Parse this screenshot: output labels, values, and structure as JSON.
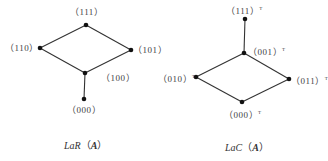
{
  "diagrams": [
    {
      "id": "lar",
      "caption": {
        "prefix": "LaR",
        "open": "（",
        "arg": "A",
        "close": "）"
      },
      "nodes": [
        {
          "id": "111",
          "label": "（111）",
          "x": 86,
          "y": 25
        },
        {
          "id": "110",
          "label": "（110）",
          "x": 40,
          "y": 48
        },
        {
          "id": "101",
          "label": "（101）",
          "x": 131,
          "y": 50
        },
        {
          "id": "100",
          "label": "（100）",
          "x": 85,
          "y": 73
        },
        {
          "id": "000",
          "label": "（000）",
          "x": 84,
          "y": 99
        }
      ],
      "edges": [
        [
          "111",
          "110"
        ],
        [
          "111",
          "101"
        ],
        [
          "110",
          "100"
        ],
        [
          "101",
          "100"
        ],
        [
          "100",
          "000"
        ]
      ]
    },
    {
      "id": "lac",
      "caption": {
        "prefix": "LaC",
        "open": "（",
        "arg": "A",
        "close": "）"
      },
      "superscript": "T",
      "nodes": [
        {
          "id": "111",
          "label": "（111）",
          "x": 245,
          "y": 19
        },
        {
          "id": "001",
          "label": "（001）",
          "x": 244,
          "y": 53
        },
        {
          "id": "010",
          "label": "（010）",
          "x": 196,
          "y": 77
        },
        {
          "id": "011",
          "label": "（011）",
          "x": 289,
          "y": 79
        },
        {
          "id": "000",
          "label": "（000）",
          "x": 242,
          "y": 102
        }
      ],
      "edges": [
        [
          "111",
          "001"
        ],
        [
          "001",
          "010"
        ],
        [
          "001",
          "011"
        ],
        [
          "010",
          "000"
        ],
        [
          "011",
          "000"
        ]
      ]
    }
  ],
  "colors": {
    "line": "#333333",
    "node": "#111111",
    "text": "#444444"
  }
}
